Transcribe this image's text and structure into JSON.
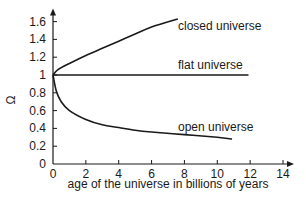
{
  "chart_data": {
    "type": "line",
    "title": "",
    "xlabel": "age of the universe in billions of years",
    "ylabel": "Ω",
    "xlim": [
      0,
      14
    ],
    "ylim": [
      0,
      1.6
    ],
    "x_ticks": [
      0,
      2,
      4,
      6,
      8,
      10,
      12,
      14
    ],
    "x_tick_labels": [
      "0",
      "2",
      "4",
      "6",
      "8",
      "10",
      "12",
      "14"
    ],
    "y_ticks": [
      0,
      0.2,
      0.4,
      0.6,
      0.8,
      1,
      1.2,
      1.4,
      1.6
    ],
    "y_tick_labels": [
      "0",
      "0.2",
      "0.4",
      "0.6",
      "0.8",
      "1",
      "1.2",
      "1.4",
      "1.6"
    ],
    "grid": false,
    "legend": "inline labels",
    "series": [
      {
        "name": "closed universe",
        "label": "closed universe",
        "points": [
          [
            0,
            1.0
          ],
          [
            0.3,
            1.06
          ],
          [
            1,
            1.13
          ],
          [
            2,
            1.22
          ],
          [
            3,
            1.3
          ],
          [
            4,
            1.38
          ],
          [
            5,
            1.46
          ],
          [
            6,
            1.54
          ],
          [
            7.6,
            1.63
          ]
        ]
      },
      {
        "name": "flat universe",
        "label": "flat universe",
        "points": [
          [
            0,
            1.0
          ],
          [
            11.9,
            1.0
          ]
        ]
      },
      {
        "name": "open universe",
        "label": "open universe",
        "points": [
          [
            0,
            1.0
          ],
          [
            0.2,
            0.82
          ],
          [
            0.5,
            0.7
          ],
          [
            1,
            0.6
          ],
          [
            2,
            0.5
          ],
          [
            3,
            0.44
          ],
          [
            4,
            0.41
          ],
          [
            5,
            0.38
          ],
          [
            6,
            0.36
          ],
          [
            8,
            0.33
          ],
          [
            10,
            0.3
          ],
          [
            10.9,
            0.28
          ]
        ]
      }
    ],
    "line_color": "#1a1a1a"
  }
}
